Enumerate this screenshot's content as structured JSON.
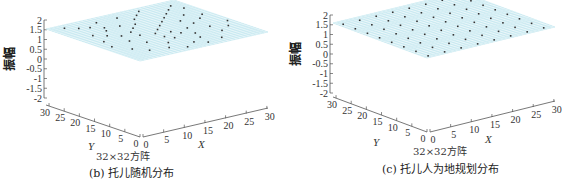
{
  "chart_data": [
    {
      "type": "surface3d",
      "panel": "b",
      "title": "(b) 托儿随机分布",
      "subtitle": "32×32方阵",
      "xlabel": "X",
      "ylabel": "Y",
      "zlabel": "振幅",
      "xlim": [
        0,
        31
      ],
      "ylim": [
        0,
        31
      ],
      "zlim": [
        -2,
        2
      ],
      "x_ticks": [
        "0",
        "5",
        "10",
        "15",
        "20",
        "25",
        "30"
      ],
      "y_ticks": [
        "0",
        "5",
        "10",
        "15",
        "20",
        "25",
        "30"
      ],
      "z_ticks": [
        "2",
        "1.5",
        "1",
        "0.5",
        "0",
        "-0.5",
        "-1",
        "-1.5",
        "-2"
      ],
      "surface": "flat mesh at z=0 over 32x32 grid",
      "mesh_color": "#bfe6ee",
      "marker_color": "#333333",
      "distribution": "random",
      "markers": [
        [
          3,
          29
        ],
        [
          5,
          27
        ],
        [
          7,
          26
        ],
        [
          9,
          24
        ],
        [
          10,
          28
        ],
        [
          12,
          23
        ],
        [
          4,
          21
        ],
        [
          6,
          19
        ],
        [
          8,
          17
        ],
        [
          13,
          20
        ],
        [
          15,
          22
        ],
        [
          17,
          25
        ],
        [
          19,
          27
        ],
        [
          21,
          29
        ],
        [
          11,
          15
        ],
        [
          14,
          14
        ],
        [
          16,
          16
        ],
        [
          18,
          18
        ],
        [
          20,
          20
        ],
        [
          22,
          22
        ],
        [
          24,
          24
        ],
        [
          26,
          26
        ],
        [
          28,
          28
        ],
        [
          2,
          12
        ],
        [
          4,
          8
        ],
        [
          6,
          5
        ],
        [
          9,
          10
        ],
        [
          12,
          7
        ],
        [
          15,
          9
        ],
        [
          18,
          11
        ],
        [
          21,
          13
        ],
        [
          24,
          15
        ],
        [
          27,
          17
        ],
        [
          29,
          19
        ],
        [
          16,
          4
        ],
        [
          19,
          6
        ],
        [
          22,
          3
        ],
        [
          25,
          7
        ],
        [
          28,
          9
        ],
        [
          30,
          12
        ],
        [
          13,
          2
        ],
        [
          10,
          4
        ],
        [
          7,
          13
        ],
        [
          23,
          18
        ],
        [
          26,
          21
        ],
        [
          17,
          13
        ],
        [
          14,
          11
        ],
        [
          20,
          9
        ],
        [
          11,
          18
        ],
        [
          8,
          22
        ],
        [
          18,
          2
        ],
        [
          25,
          11
        ],
        [
          29,
          25
        ],
        [
          3,
          16
        ],
        [
          15,
          28
        ]
      ]
    },
    {
      "type": "surface3d",
      "panel": "c",
      "title": "(c) 托儿人为地规划分布",
      "subtitle": "32×32方阵",
      "xlabel": "X",
      "ylabel": "Y",
      "zlabel": "振幅",
      "xlim": [
        0,
        31
      ],
      "ylim": [
        0,
        31
      ],
      "zlim": [
        -2,
        2
      ],
      "x_ticks": [
        "0",
        "5",
        "10",
        "15",
        "20",
        "25",
        "30"
      ],
      "y_ticks": [
        "0",
        "5",
        "10",
        "15",
        "20",
        "25",
        "30"
      ],
      "z_ticks": [
        "2",
        "1.5",
        "1",
        "0.5",
        "0",
        "-0.5",
        "-1",
        "-1.5",
        "-2"
      ],
      "surface": "flat mesh at z=0 over 32x32 grid",
      "mesh_color": "#bfe6ee",
      "marker_color": "#333333",
      "distribution": "regular grid (every 4 nodes)",
      "marker_step": 4,
      "marker_offset": 1
    }
  ],
  "panels": {
    "b": {
      "caption": "(b) 托儿随机分布",
      "matrix_label": "32×32方阵",
      "zlabel": "振幅",
      "xlabel": "X",
      "ylabel": "Y"
    },
    "c": {
      "caption": "(c) 托儿人为地规划分布",
      "matrix_label": "32×32方阵",
      "zlabel": "振幅",
      "xlabel": "X",
      "ylabel": "Y"
    }
  }
}
